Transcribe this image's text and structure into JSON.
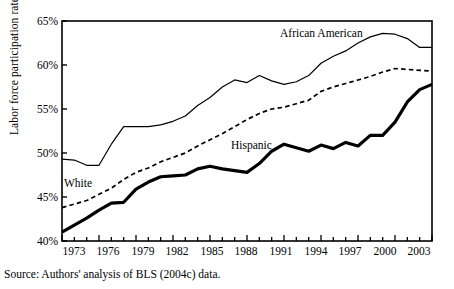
{
  "chart_data": {
    "type": "line",
    "title": "",
    "xlabel": "",
    "ylabel": "Labor force participation rate",
    "xlim": [
      1973,
      2003
    ],
    "ylim": [
      40,
      65
    ],
    "grid": false,
    "legend_position": "inline-annotations",
    "ytick_labels": [
      "40%",
      "45%",
      "50%",
      "55%",
      "60%",
      "65%"
    ],
    "ytick_values": [
      40,
      45,
      50,
      55,
      60,
      65
    ],
    "xtick_labels": [
      "1973",
      "1976",
      "1979",
      "1982",
      "1985",
      "1988",
      "1991",
      "1994",
      "1997",
      "2000",
      "2003"
    ],
    "xtick_values": [
      1973,
      1976,
      1979,
      1982,
      1985,
      1988,
      1991,
      1994,
      1997,
      2000,
      2003
    ],
    "x": [
      1973,
      1974,
      1975,
      1976,
      1977,
      1978,
      1979,
      1980,
      1981,
      1982,
      1983,
      1984,
      1985,
      1986,
      1987,
      1988,
      1989,
      1990,
      1991,
      1992,
      1993,
      1994,
      1995,
      1996,
      1997,
      1998,
      1999,
      2000,
      2001,
      2002,
      2003
    ],
    "series": [
      {
        "name": "African American",
        "style": "thin-solid",
        "color": "#000000",
        "values": [
          49.3,
          49.2,
          48.6,
          48.6,
          51.0,
          53.0,
          53.0,
          53.0,
          53.2,
          53.6,
          54.2,
          55.4,
          56.3,
          57.5,
          58.3,
          58.0,
          58.8,
          58.2,
          57.8,
          58.1,
          58.8,
          60.2,
          61.0,
          61.6,
          62.5,
          63.2,
          63.6,
          63.5,
          63.0,
          62.0,
          62.0
        ]
      },
      {
        "name": "White",
        "style": "dashed",
        "color": "#000000",
        "values": [
          43.8,
          44.2,
          44.6,
          45.3,
          46.0,
          47.0,
          47.8,
          48.3,
          49.0,
          49.5,
          50.0,
          50.8,
          51.5,
          52.2,
          53.0,
          53.8,
          54.5,
          55.0,
          55.2,
          55.6,
          56.0,
          57.0,
          57.5,
          57.9,
          58.3,
          58.7,
          59.2,
          59.6,
          59.5,
          59.4,
          59.3
        ]
      },
      {
        "name": "Hispanic",
        "style": "thick-solid",
        "color": "#000000",
        "values": [
          41.0,
          41.8,
          42.6,
          43.5,
          44.3,
          44.4,
          45.9,
          46.7,
          47.3,
          47.4,
          47.5,
          48.2,
          48.5,
          48.2,
          48.0,
          47.8,
          48.8,
          50.2,
          51.0,
          50.6,
          50.2,
          50.9,
          50.5,
          51.2,
          50.8,
          52.0,
          52.0,
          53.5,
          55.8,
          57.2,
          57.8
        ]
      }
    ],
    "annotations": [
      {
        "text": "African American",
        "x": 1990,
        "y": 64.0
      },
      {
        "text": "White",
        "x": 1973.8,
        "y": 46.9
      },
      {
        "text": "Hispanic",
        "x": 1987.7,
        "y": 51.7
      }
    ]
  },
  "source": {
    "text": "Source: Authors' analysis of BLS (2004c) data."
  }
}
